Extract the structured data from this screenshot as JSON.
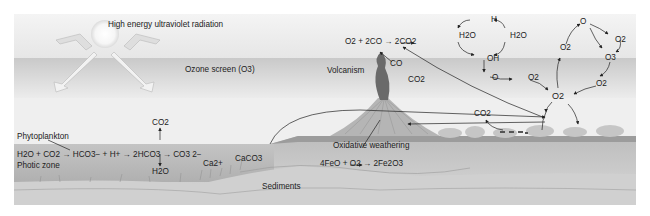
{
  "diagram": {
    "title": "",
    "atmosphere": {
      "uv_label": "High energy ultraviolet radiation",
      "ozone_label": "Ozone screen (O3)"
    },
    "ocean": {
      "phytoplankton_label": "Phytoplankton",
      "photic_zone_label": "Photic zone",
      "carbonate_equation": {
        "reactants": "H2O + CO2",
        "step1": "HCO3− + H+",
        "step2": "2HCO3",
        "step2_up": "CO2",
        "step2_down": "H2O",
        "step3_top": "CO3 2−",
        "step3_bottom": "Ca2+",
        "product": "CaCO3"
      },
      "sediments_label": "Sediments"
    },
    "land": {
      "volcanism_label": "Volcanism",
      "co_label": "CO",
      "co2_volcano_label": "CO2",
      "co_oxidation_equation": "O2 + 2CO → 2CO2",
      "oxidative_weathering_label": "Oxidative weathering",
      "iron_equation": "4FeO + O2 → 2Fe2O3",
      "animal_co2_label": "CO2"
    },
    "photolysis_cycle": {
      "nodes": [
        "H",
        "H2O",
        "H2O",
        "OH",
        "O",
        "O2"
      ]
    },
    "ozone_cycle": {
      "nodes": [
        "O",
        "O2",
        "O2",
        "O3",
        "O2"
      ]
    },
    "central_node": "O2"
  }
}
